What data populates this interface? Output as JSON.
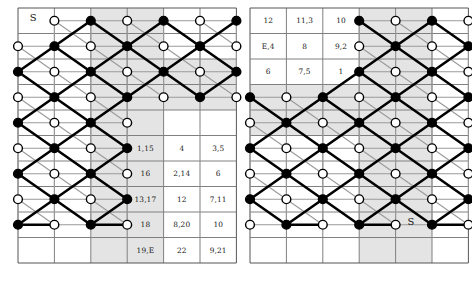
{
  "figure": {
    "colors": {
      "grid_line": "#808080",
      "grid_border": "#555555",
      "shade": "#e4e4e4",
      "path_bold": "#000000",
      "path_ghost": "#9a9a9a",
      "node_fill_black": "#000000",
      "node_fill_white": "#ffffff",
      "node_stroke": "#000000",
      "text": "#222222",
      "background": "#ffffff"
    },
    "panels": [
      {
        "name": "left-panel",
        "x": 18,
        "y": 8,
        "cols": 6,
        "rows": 10,
        "cell_w": 36.4,
        "cell_h": 25.5,
        "shaded_columns": [
          2,
          3
        ],
        "shaded_band": {
          "cols": [
            4,
            5
          ],
          "rows": [
            2,
            3
          ]
        },
        "markers": [
          {
            "label": "S",
            "col": 0,
            "row": 0
          }
        ],
        "numbers": [
          {
            "col": 3,
            "row": 5,
            "text": "1,15"
          },
          {
            "col": 4,
            "row": 5,
            "text": "4"
          },
          {
            "col": 5,
            "row": 5,
            "text": "3,5"
          },
          {
            "col": 3,
            "row": 6,
            "text": "16"
          },
          {
            "col": 4,
            "row": 6,
            "text": "2,14"
          },
          {
            "col": 5,
            "row": 6,
            "text": "6"
          },
          {
            "col": 3,
            "row": 7,
            "text": "13,17"
          },
          {
            "col": 4,
            "row": 7,
            "text": "12"
          },
          {
            "col": 5,
            "row": 7,
            "text": "7,11"
          },
          {
            "col": 3,
            "row": 8,
            "text": "18"
          },
          {
            "col": 4,
            "row": 8,
            "text": "8,20"
          },
          {
            "col": 5,
            "row": 8,
            "text": "10"
          },
          {
            "col": 3,
            "row": 9,
            "text": "19,E"
          },
          {
            "col": 4,
            "row": 9,
            "text": "22"
          },
          {
            "col": 5,
            "row": 9,
            "text": "9,21"
          }
        ],
        "nodes": [
          {
            "col": 1,
            "row": 0,
            "type": "white"
          },
          {
            "col": 2,
            "row": 0,
            "type": "black"
          },
          {
            "col": 3,
            "row": 0,
            "type": "white"
          },
          {
            "col": 4,
            "row": 0,
            "type": "black"
          },
          {
            "col": 5,
            "row": 0,
            "type": "white"
          },
          {
            "col": 6,
            "row": 0,
            "type": "black"
          },
          {
            "col": 0,
            "row": 1,
            "type": "white"
          },
          {
            "col": 1,
            "row": 1,
            "type": "black"
          },
          {
            "col": 2,
            "row": 1,
            "type": "white"
          },
          {
            "col": 3,
            "row": 1,
            "type": "black"
          },
          {
            "col": 4,
            "row": 1,
            "type": "white"
          },
          {
            "col": 5,
            "row": 1,
            "type": "black"
          },
          {
            "col": 6,
            "row": 1,
            "type": "white"
          },
          {
            "col": 0,
            "row": 2,
            "type": "black"
          },
          {
            "col": 1,
            "row": 2,
            "type": "white"
          },
          {
            "col": 2,
            "row": 2,
            "type": "black"
          },
          {
            "col": 3,
            "row": 2,
            "type": "white"
          },
          {
            "col": 4,
            "row": 2,
            "type": "black"
          },
          {
            "col": 5,
            "row": 2,
            "type": "white"
          },
          {
            "col": 6,
            "row": 2,
            "type": "black"
          },
          {
            "col": 0,
            "row": 3,
            "type": "white"
          },
          {
            "col": 1,
            "row": 3,
            "type": "black"
          },
          {
            "col": 2,
            "row": 3,
            "type": "white"
          },
          {
            "col": 3,
            "row": 3,
            "type": "black"
          },
          {
            "col": 4,
            "row": 3,
            "type": "white"
          },
          {
            "col": 5,
            "row": 3,
            "type": "black"
          },
          {
            "col": 6,
            "row": 3,
            "type": "white"
          },
          {
            "col": 0,
            "row": 4,
            "type": "black"
          },
          {
            "col": 1,
            "row": 4,
            "type": "white"
          },
          {
            "col": 2,
            "row": 4,
            "type": "black"
          },
          {
            "col": 3,
            "row": 4,
            "type": "white"
          },
          {
            "col": 0,
            "row": 5,
            "type": "white"
          },
          {
            "col": 1,
            "row": 5,
            "type": "black"
          },
          {
            "col": 2,
            "row": 5,
            "type": "white"
          },
          {
            "col": 3,
            "row": 5,
            "type": "black"
          },
          {
            "col": 0,
            "row": 6,
            "type": "black"
          },
          {
            "col": 1,
            "row": 6,
            "type": "white"
          },
          {
            "col": 2,
            "row": 6,
            "type": "black"
          },
          {
            "col": 3,
            "row": 6,
            "type": "white"
          },
          {
            "col": 0,
            "row": 7,
            "type": "white"
          },
          {
            "col": 1,
            "row": 7,
            "type": "black"
          },
          {
            "col": 2,
            "row": 7,
            "type": "white"
          },
          {
            "col": 3,
            "row": 7,
            "type": "black"
          },
          {
            "col": 0,
            "row": 8,
            "type": "black"
          },
          {
            "col": 1,
            "row": 8,
            "type": "white"
          },
          {
            "col": 2,
            "row": 8,
            "type": "black"
          },
          {
            "col": 3,
            "row": 8,
            "type": "white"
          }
        ]
      },
      {
        "name": "right-panel",
        "x": 250,
        "y": 8,
        "cols": 6,
        "rows": 10,
        "cell_w": 36.4,
        "cell_h": 25.5,
        "shaded_columns": [
          3,
          4
        ],
        "shaded_band": {
          "cols": [
            0,
            1,
            2
          ],
          "rows": [
            3,
            4
          ]
        },
        "markers": [
          {
            "label": "S",
            "col": 4,
            "row": 8
          }
        ],
        "numbers": [
          {
            "col": 0,
            "row": 0,
            "text": "12"
          },
          {
            "col": 1,
            "row": 0,
            "text": "11,3"
          },
          {
            "col": 2,
            "row": 0,
            "text": "10"
          },
          {
            "col": 0,
            "row": 1,
            "text": "E,4"
          },
          {
            "col": 1,
            "row": 1,
            "text": "8"
          },
          {
            "col": 2,
            "row": 1,
            "text": "9,2"
          },
          {
            "col": 0,
            "row": 2,
            "text": "6"
          },
          {
            "col": 1,
            "row": 2,
            "text": "7,5"
          },
          {
            "col": 2,
            "row": 2,
            "text": "1"
          }
        ],
        "nodes": [
          {
            "col": 3,
            "row": 0,
            "type": "black"
          },
          {
            "col": 4,
            "row": 0,
            "type": "white"
          },
          {
            "col": 5,
            "row": 0,
            "type": "black"
          },
          {
            "col": 6,
            "row": 0,
            "type": "white"
          },
          {
            "col": 3,
            "row": 1,
            "type": "white"
          },
          {
            "col": 4,
            "row": 1,
            "type": "black"
          },
          {
            "col": 5,
            "row": 1,
            "type": "white"
          },
          {
            "col": 6,
            "row": 1,
            "type": "black"
          },
          {
            "col": 3,
            "row": 2,
            "type": "black"
          },
          {
            "col": 4,
            "row": 2,
            "type": "white"
          },
          {
            "col": 5,
            "row": 2,
            "type": "black"
          },
          {
            "col": 6,
            "row": 2,
            "type": "white"
          },
          {
            "col": 0,
            "row": 3,
            "type": "black"
          },
          {
            "col": 1,
            "row": 3,
            "type": "white"
          },
          {
            "col": 2,
            "row": 3,
            "type": "black"
          },
          {
            "col": 3,
            "row": 3,
            "type": "white"
          },
          {
            "col": 4,
            "row": 3,
            "type": "black"
          },
          {
            "col": 5,
            "row": 3,
            "type": "white"
          },
          {
            "col": 6,
            "row": 3,
            "type": "black"
          },
          {
            "col": 0,
            "row": 4,
            "type": "white"
          },
          {
            "col": 1,
            "row": 4,
            "type": "black"
          },
          {
            "col": 2,
            "row": 4,
            "type": "white"
          },
          {
            "col": 3,
            "row": 4,
            "type": "black"
          },
          {
            "col": 4,
            "row": 4,
            "type": "white"
          },
          {
            "col": 5,
            "row": 4,
            "type": "black"
          },
          {
            "col": 6,
            "row": 4,
            "type": "white"
          },
          {
            "col": 0,
            "row": 5,
            "type": "black"
          },
          {
            "col": 1,
            "row": 5,
            "type": "white"
          },
          {
            "col": 2,
            "row": 5,
            "type": "black"
          },
          {
            "col": 3,
            "row": 5,
            "type": "white"
          },
          {
            "col": 4,
            "row": 5,
            "type": "black"
          },
          {
            "col": 5,
            "row": 5,
            "type": "white"
          },
          {
            "col": 6,
            "row": 5,
            "type": "black"
          },
          {
            "col": 0,
            "row": 6,
            "type": "white"
          },
          {
            "col": 1,
            "row": 6,
            "type": "black"
          },
          {
            "col": 2,
            "row": 6,
            "type": "white"
          },
          {
            "col": 3,
            "row": 6,
            "type": "black"
          },
          {
            "col": 4,
            "row": 6,
            "type": "white"
          },
          {
            "col": 5,
            "row": 6,
            "type": "black"
          },
          {
            "col": 6,
            "row": 6,
            "type": "white"
          },
          {
            "col": 0,
            "row": 7,
            "type": "black"
          },
          {
            "col": 1,
            "row": 7,
            "type": "white"
          },
          {
            "col": 2,
            "row": 7,
            "type": "black"
          },
          {
            "col": 3,
            "row": 7,
            "type": "white"
          },
          {
            "col": 4,
            "row": 7,
            "type": "black"
          },
          {
            "col": 5,
            "row": 7,
            "type": "white"
          },
          {
            "col": 6,
            "row": 7,
            "type": "black"
          },
          {
            "col": 0,
            "row": 8,
            "type": "white"
          },
          {
            "col": 1,
            "row": 8,
            "type": "black"
          },
          {
            "col": 2,
            "row": 8,
            "type": "white"
          },
          {
            "col": 3,
            "row": 8,
            "type": "black"
          },
          {
            "col": 4,
            "row": 8,
            "type": "white"
          },
          {
            "col": 5,
            "row": 8,
            "type": "black"
          },
          {
            "col": 6,
            "row": 8,
            "type": "white"
          }
        ]
      }
    ]
  }
}
